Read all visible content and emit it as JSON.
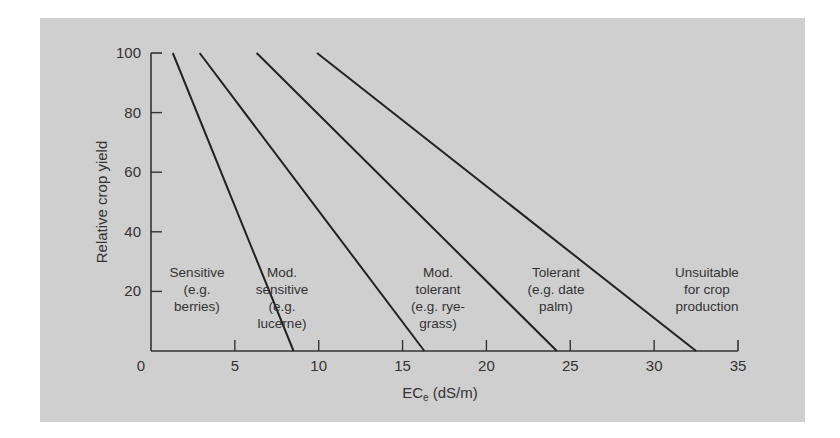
{
  "chart_data": {
    "type": "line",
    "title": "",
    "xlabel": "EC",
    "xlabel_sub": "e",
    "xlabel_unit": " (dS/m)",
    "ylabel": "Relative crop yield",
    "xlim": [
      0,
      35
    ],
    "ylim": [
      0,
      100
    ],
    "x_ticks": [
      0,
      5,
      10,
      15,
      20,
      25,
      30,
      35
    ],
    "y_ticks": [
      20,
      40,
      60,
      80,
      100
    ],
    "grid": false,
    "series": [
      {
        "name": "Sensitive boundary",
        "x": [
          1.3,
          8.5
        ],
        "y": [
          100,
          0
        ]
      },
      {
        "name": "Mod. sensitive boundary",
        "x": [
          2.9,
          16.3
        ],
        "y": [
          100,
          0
        ]
      },
      {
        "name": "Mod. tolerant boundary",
        "x": [
          6.3,
          24.2
        ],
        "y": [
          100,
          0
        ]
      },
      {
        "name": "Tolerant boundary",
        "x": [
          9.9,
          32.5
        ],
        "y": [
          100,
          0
        ]
      }
    ],
    "annotations": [
      {
        "lines": [
          "Sensitive",
          "(e.g.",
          "berries)"
        ]
      },
      {
        "lines": [
          "Mod.",
          "sensitive",
          "(e.g.",
          "lucerne)"
        ]
      },
      {
        "lines": [
          "Mod.",
          "tolerant",
          "(e.g. rye-",
          "grass)"
        ]
      },
      {
        "lines": [
          "Tolerant",
          "(e.g. date",
          "palm)"
        ]
      },
      {
        "lines": [
          "Unsuitable",
          "for crop",
          "production"
        ]
      }
    ]
  }
}
